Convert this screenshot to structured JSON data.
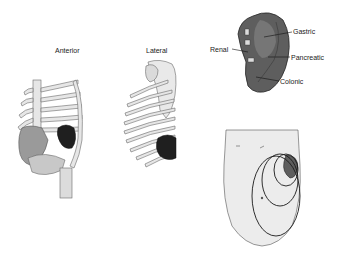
{
  "figure": {
    "panels": [
      {
        "id": "anterior",
        "title": "Anterior"
      },
      {
        "id": "lateral",
        "title": "Lateral"
      },
      {
        "id": "visceral-surface",
        "labels": [
          "Gastric",
          "Renal",
          "Pancreatic",
          "Colonic"
        ]
      },
      {
        "id": "abdomen-enlargement"
      }
    ]
  },
  "labels": {
    "anterior": "Anterior",
    "lateral": "Lateral",
    "gastric": "Gastric",
    "renal": "Renal",
    "pancreatic": "Pancreatic",
    "colonic": "Colonic"
  },
  "colors": {
    "bone": "#e6e6e6",
    "bone_outline": "#6a6a6a",
    "spleen": "#5e5e5e",
    "spleen_dark": "#3a3a3a",
    "liver": "#9a9a9a",
    "skin": "#ececec",
    "outline": "#2a2a2a"
  }
}
